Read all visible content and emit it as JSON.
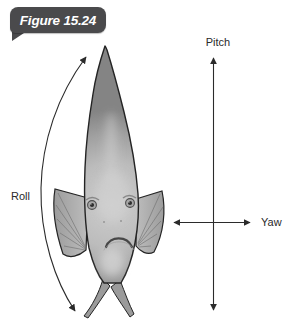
{
  "figure": {
    "label": "Figure 15.24"
  },
  "axes": {
    "pitch_label": "Pitch",
    "yaw_label": "Yaw",
    "roll_label": "Roll"
  },
  "colors": {
    "background": "#ffffff",
    "badge_bg": "#4a4a4c",
    "badge_text": "#ffffff",
    "arrow": "#2b2b2b",
    "label_text": "#2a2a2a",
    "fish_outline": "#242424"
  }
}
